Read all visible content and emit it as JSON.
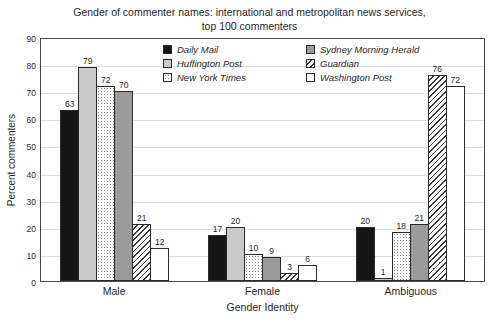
{
  "title": {
    "line1": "Gender of commenter names: international and metropolitan news services,",
    "line2": "top 100 commenters"
  },
  "chart_data": {
    "type": "bar",
    "categories": [
      "Male",
      "Female",
      "Ambiguous"
    ],
    "series": [
      {
        "name": "Daily Mail",
        "values": [
          63,
          17,
          20
        ],
        "color": "#161616",
        "pattern": "solid"
      },
      {
        "name": "Huffington Post",
        "values": [
          79,
          20,
          1
        ],
        "color": "#c9c9c9",
        "pattern": "solid"
      },
      {
        "name": "New York Times",
        "values": [
          72,
          10,
          18
        ],
        "color": "#ffffff",
        "pattern": "dots"
      },
      {
        "name": "Sydney Morning Herald",
        "values": [
          70,
          9,
          21
        ],
        "color": "#9b9b9b",
        "pattern": "solid"
      },
      {
        "name": "Guardian",
        "values": [
          21,
          3,
          76
        ],
        "color": "#ffffff",
        "pattern": "hatch"
      },
      {
        "name": "Washington Post",
        "values": [
          12,
          6,
          72
        ],
        "color": "#ffffff",
        "pattern": "solid"
      }
    ],
    "xlabel": "Gender Identity",
    "ylabel": "Percent commenters",
    "ylim": [
      0,
      90
    ],
    "ytick_step": 10,
    "grid": true,
    "value_labels": true,
    "legend_position": "top-inside",
    "legend_columns": 2
  }
}
